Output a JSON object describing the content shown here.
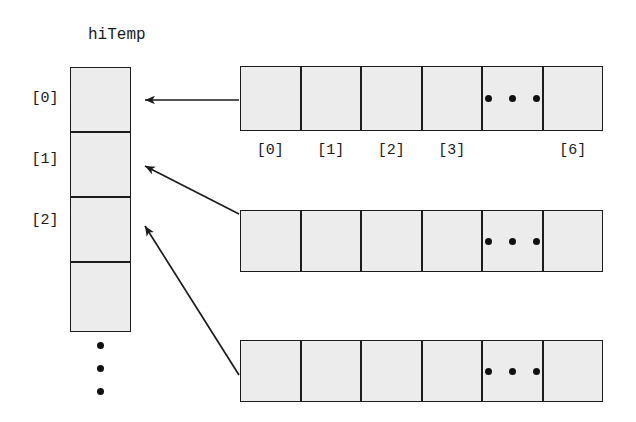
{
  "diagram": {
    "title": "hiTemp",
    "fill_color": "#ececec",
    "stroke_color": "#1c1c1c",
    "dot_color": "#111111",
    "background": "#ffffff"
  },
  "column": {
    "name": "hiTemp",
    "cells": [
      {
        "label": "[0]",
        "has_label": true
      },
      {
        "label": "[1]",
        "has_label": true
      },
      {
        "label": "[2]",
        "has_label": true
      },
      {
        "label": "",
        "has_label": false
      }
    ],
    "continuation": "vertical-ellipsis",
    "continuation_dots": 3
  },
  "rows": [
    {
      "name": "row-0",
      "cells": [
        {
          "index_label": "[0]",
          "show_index": true,
          "content": ""
        },
        {
          "index_label": "[1]",
          "show_index": true,
          "content": ""
        },
        {
          "index_label": "[2]",
          "show_index": true,
          "content": ""
        },
        {
          "index_label": "[3]",
          "show_index": true,
          "content": ""
        },
        {
          "index_label": "",
          "show_index": false,
          "content": "horizontal-ellipsis"
        },
        {
          "index_label": "[6]",
          "show_index": true,
          "content": ""
        }
      ],
      "show_index_labels": true
    },
    {
      "name": "row-1",
      "cells": [
        {
          "index_label": "[0]",
          "show_index": false,
          "content": ""
        },
        {
          "index_label": "[1]",
          "show_index": false,
          "content": ""
        },
        {
          "index_label": "[2]",
          "show_index": false,
          "content": ""
        },
        {
          "index_label": "[3]",
          "show_index": false,
          "content": ""
        },
        {
          "index_label": "",
          "show_index": false,
          "content": "horizontal-ellipsis"
        },
        {
          "index_label": "[6]",
          "show_index": false,
          "content": ""
        }
      ],
      "show_index_labels": false
    },
    {
      "name": "row-2",
      "cells": [
        {
          "index_label": "[0]",
          "show_index": false,
          "content": ""
        },
        {
          "index_label": "[1]",
          "show_index": false,
          "content": ""
        },
        {
          "index_label": "[2]",
          "show_index": false,
          "content": ""
        },
        {
          "index_label": "[3]",
          "show_index": false,
          "content": ""
        },
        {
          "index_label": "",
          "show_index": false,
          "content": "horizontal-ellipsis"
        },
        {
          "index_label": "[6]",
          "show_index": false,
          "content": ""
        }
      ],
      "show_index_labels": false
    }
  ],
  "arrows": [
    {
      "name": "arrow-row0-to-cell0",
      "from_row": 0,
      "to_cell": 0,
      "style": "horizontal"
    },
    {
      "name": "arrow-row1-to-cell1",
      "from_row": 1,
      "to_cell": 1,
      "style": "diagonal"
    },
    {
      "name": "arrow-row2-to-cell2",
      "from_row": 2,
      "to_cell": 2,
      "style": "diagonal"
    }
  ]
}
